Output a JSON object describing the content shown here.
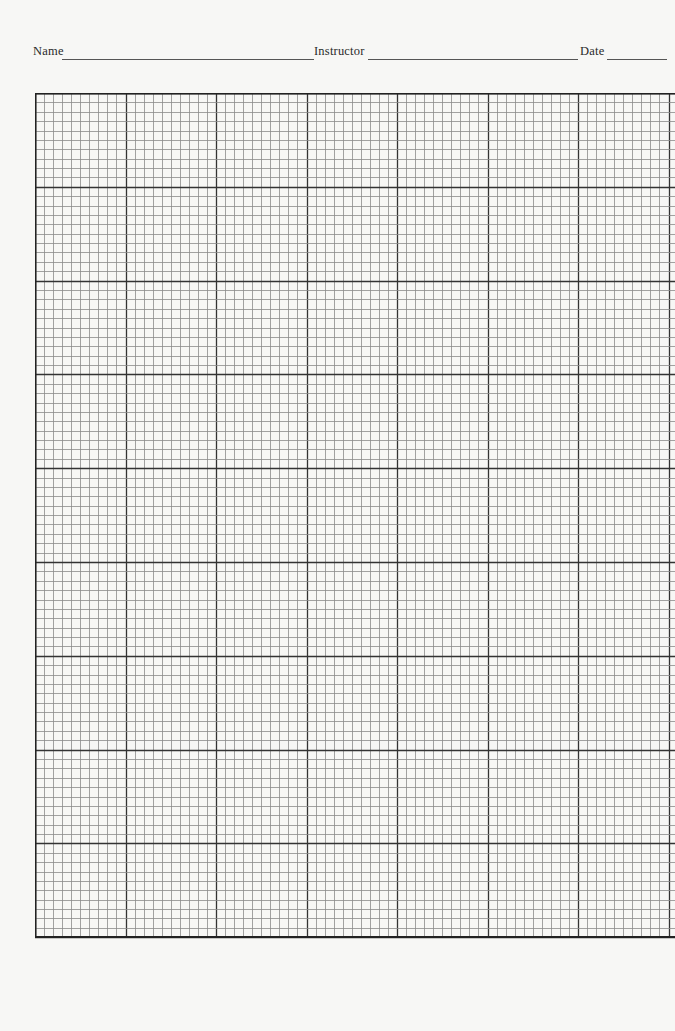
{
  "header": {
    "fields": [
      {
        "label": "Name",
        "value": ""
      },
      {
        "label": "Instructor",
        "value": ""
      },
      {
        "label": "Date",
        "value": ""
      }
    ]
  },
  "grid": {
    "major_columns_visible": 7,
    "major_rows": 9,
    "minor_per_major": 10,
    "minor_line_color": "#8a8a8a",
    "major_line_color": "#333333",
    "border_color": "#222222"
  }
}
